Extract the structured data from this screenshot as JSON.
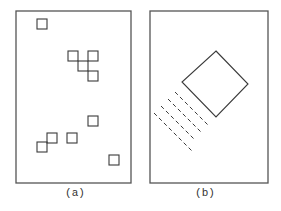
{
  "figure": {
    "stroke_color": "#3a3a3a",
    "frame_color": "#555555",
    "panels": [
      {
        "id": "a",
        "caption": "(a)",
        "caption_pos": {
          "x": 75,
          "y": 187
        },
        "frame": {
          "x": 16,
          "y": 11,
          "w": 115,
          "h": 172
        },
        "squares": [
          {
            "x": 37,
            "y": 19,
            "s": 10
          },
          {
            "x": 68,
            "y": 51,
            "s": 10
          },
          {
            "x": 88,
            "y": 51,
            "s": 10
          },
          {
            "x": 78,
            "y": 61,
            "s": 10
          },
          {
            "x": 88,
            "y": 71,
            "s": 10
          },
          {
            "x": 88,
            "y": 116,
            "s": 10
          },
          {
            "x": 47,
            "y": 133,
            "s": 10
          },
          {
            "x": 67,
            "y": 133,
            "s": 10
          },
          {
            "x": 37,
            "y": 142,
            "s": 10
          },
          {
            "x": 109,
            "y": 155,
            "s": 10
          }
        ]
      },
      {
        "id": "b",
        "caption": "(b)",
        "caption_pos": {
          "x": 205,
          "y": 187
        },
        "frame": {
          "x": 150,
          "y": 11,
          "w": 118,
          "h": 172
        },
        "diamond": {
          "top": [
            216,
            51
          ],
          "right": [
            248,
            84
          ],
          "bottom": [
            216,
            117
          ],
          "left": [
            182,
            82
          ]
        },
        "dashed_lines": [
          {
            "x1": 175,
            "y1": 92,
            "x2": 209,
            "y2": 126
          },
          {
            "x1": 168,
            "y1": 99,
            "x2": 202,
            "y2": 133
          },
          {
            "x1": 161,
            "y1": 106,
            "x2": 195,
            "y2": 140
          },
          {
            "x1": 154,
            "y1": 113,
            "x2": 193,
            "y2": 152
          }
        ]
      }
    ]
  }
}
